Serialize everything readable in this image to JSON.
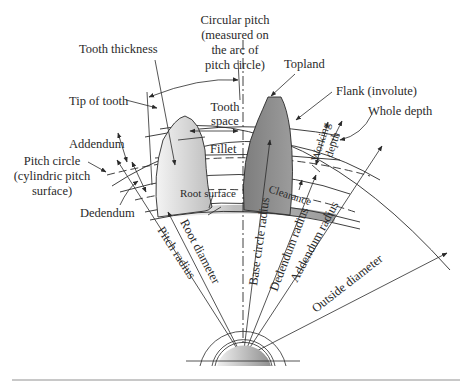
{
  "diagram": {
    "labels": {
      "circular_pitch_1": "Circular pitch",
      "circular_pitch_2": "(measured on",
      "circular_pitch_3": "the arc of",
      "circular_pitch_4": "pitch circle)",
      "tooth_thickness": "Tooth thickness",
      "topland": "Topland",
      "flank": "Flank (involute)",
      "whole_depth": "Whole depth",
      "tip_of_tooth": "Tip of tooth",
      "tooth_space_1": "Tooth",
      "tooth_space_2": "space",
      "addendum": "Addendum",
      "pitch_circle_1": "Pitch circle",
      "pitch_circle_2": "(cylindric pitch",
      "pitch_circle_3": "surface)",
      "fillet": "Fillet",
      "working_depth_1": "Working",
      "working_depth_2": "depth",
      "dedendum": "Dedendum",
      "root_surface": "Root surface",
      "clearance": "Clearance",
      "root_diameter": "Root diameter",
      "pitch_radius": "Pitch radius",
      "base_circle_radius": "Base circle radius",
      "dedendum_radius": "Dedendum radius",
      "addendum_radius": "Addendum radius",
      "outside_diameter": "Outside diameter"
    },
    "colors": {
      "left_tooth_fill": "#d8d8d8",
      "right_tooth_fill": "#8a8a8a",
      "root_band": "#a0a0a0",
      "line": "#2a2a2a",
      "footer_rule": "#c8c8c8"
    }
  }
}
